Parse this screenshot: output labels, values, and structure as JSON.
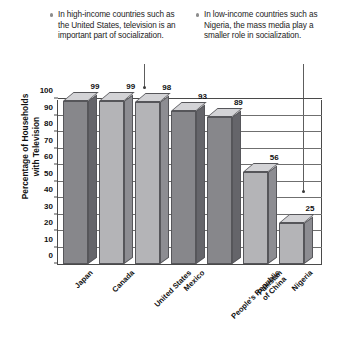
{
  "chart_data": {
    "type": "bar",
    "title": "",
    "xlabel": "",
    "ylabel": "Percentage of Households with Television",
    "ylabel_line1": "Percentage of Households",
    "ylabel_line2": "with Television",
    "ylim": [
      0,
      100
    ],
    "ytick_step": 10,
    "grid": true,
    "legend": "none",
    "categories": [
      "Japan",
      "Canada",
      "United States",
      "Mexico",
      "People's Republic of China",
      "Pakistan",
      "Nigeria"
    ],
    "category_lines": [
      [
        "Japan"
      ],
      [
        "Canada"
      ],
      [
        "United States"
      ],
      [
        "Mexico"
      ],
      [
        "People's Republic",
        "of China"
      ],
      [
        "Pakistan"
      ],
      [
        "Nigeria"
      ]
    ],
    "values": [
      99,
      99,
      98,
      93,
      89,
      56,
      25
    ],
    "yticks": [
      0,
      10,
      20,
      30,
      40,
      50,
      60,
      70,
      80,
      90,
      100
    ],
    "bar_shades": [
      "dark",
      "light",
      "light",
      "dark",
      "dark",
      "light",
      "light"
    ],
    "annotations": [
      {
        "id": "high-income",
        "text": "In high-income countries such as the United States, television is an important part of socialization.",
        "points_to": "United States"
      },
      {
        "id": "low-income",
        "text": "In low-income countries such as Nigeria, the mass media play a smaller role in socialization.",
        "points_to": "Nigeria"
      }
    ],
    "colors": {
      "bar_dark_front": "#87878b",
      "bar_light_front": "#b4b4b7",
      "axis": "#4a4a4a",
      "grid": "#6f6f6f",
      "background": "#ffffff"
    }
  },
  "callouts": {
    "left": {
      "text": "In high-income countries such as the United States, television is an important part of socialization."
    },
    "right": {
      "text": "In low-income countries such as Nigeria, the mass media play a smaller role in socialization."
    }
  }
}
